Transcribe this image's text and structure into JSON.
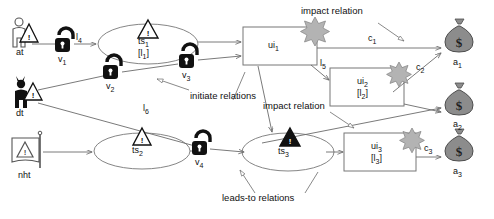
{
  "diagram": {
    "colors": {
      "line": "#6b6b6b",
      "text": "#111111",
      "asset_fill": "#8c8c8c",
      "asset_stroke": "#4d4d4d",
      "star_fill": "#b3b3b3",
      "star_stroke": "#8a8a8a",
      "lock_fill": "#111111",
      "node_stroke": "#777777"
    },
    "actors": [
      {
        "id": "at",
        "label": "at",
        "icon": "person-warning-icon",
        "desc": "outline person with warning triangle"
      },
      {
        "id": "dt",
        "label": "dt",
        "icon": "devil-person-warning-icon",
        "desc": "black horned person with warning triangle"
      },
      {
        "id": "nht",
        "label": "nht",
        "icon": "flag-warning-icon",
        "desc": "flag with warning triangle"
      }
    ],
    "vulnerabilities": [
      {
        "id": "v1",
        "label": "v",
        "sub": "1",
        "icon": "open-padlock-icon"
      },
      {
        "id": "v2",
        "label": "v",
        "sub": "2",
        "icon": "open-padlock-icon"
      },
      {
        "id": "v3",
        "label": "v",
        "sub": "3",
        "icon": "open-padlock-icon"
      },
      {
        "id": "v4",
        "label": "v",
        "sub": "4",
        "icon": "open-padlock-icon"
      }
    ],
    "threat_sources": [
      {
        "id": "ts1",
        "label": "ts",
        "sub": "1",
        "likelihood": "[l",
        "likelihood_sub": "1",
        "likelihood_end": "]",
        "triangle": "outline"
      },
      {
        "id": "ts2",
        "label": "ts",
        "sub": "2",
        "likelihood": "",
        "likelihood_sub": "",
        "likelihood_end": "",
        "triangle": "outline"
      },
      {
        "id": "ts3",
        "label": "ts",
        "sub": "3",
        "likelihood": "",
        "likelihood_sub": "",
        "likelihood_end": "",
        "triangle": "filled"
      }
    ],
    "unwanted_incidents": [
      {
        "id": "ui1",
        "label": "ui",
        "sub": "1",
        "likelihood": "",
        "likelihood_sub": "",
        "likelihood_end": ""
      },
      {
        "id": "ui2",
        "label": "ui",
        "sub": "2",
        "likelihood": "[l",
        "likelihood_sub": "2",
        "likelihood_end": "]"
      },
      {
        "id": "ui3",
        "label": "ui",
        "sub": "3",
        "likelihood": "[l",
        "likelihood_sub": "3",
        "likelihood_end": "]"
      }
    ],
    "assets": [
      {
        "id": "a1",
        "label": "a",
        "sub": "1",
        "icon": "money-bag-icon",
        "symbol": "$"
      },
      {
        "id": "a2",
        "label": "a",
        "sub": "2",
        "icon": "money-bag-icon",
        "symbol": "$"
      },
      {
        "id": "a3",
        "label": "a",
        "sub": "3",
        "icon": "money-bag-icon",
        "symbol": "$"
      }
    ],
    "edge_labels": [
      {
        "id": "l4",
        "label": "l",
        "sub": "4"
      },
      {
        "id": "l6",
        "label": "l",
        "sub": "6"
      },
      {
        "id": "l5",
        "label": "l",
        "sub": "5"
      },
      {
        "id": "c1",
        "label": "c",
        "sub": "1"
      },
      {
        "id": "c2",
        "label": "c",
        "sub": "2"
      },
      {
        "id": "c3",
        "label": "c",
        "sub": "3"
      }
    ],
    "annotations": [
      {
        "id": "impact-top",
        "text": "impact relation"
      },
      {
        "id": "initiate",
        "text": "initiate relations"
      },
      {
        "id": "impact-middle",
        "text": "impact relation"
      },
      {
        "id": "leads-to",
        "text": "leads-to relations"
      }
    ]
  }
}
